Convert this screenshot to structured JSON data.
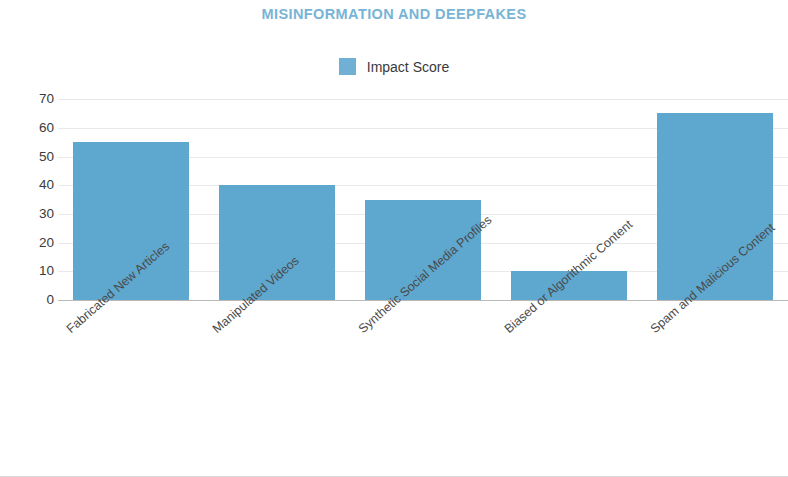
{
  "chart_data": {
    "type": "bar",
    "title": "MISINFORMATION AND DEEPFAKES",
    "categories": [
      "Fabricated New Articles",
      "Manipulated Videos",
      "Synthetic Social Media Profiles",
      "Biased or Algorithmic Content",
      "Spam and Malicious Content"
    ],
    "series": [
      {
        "name": "Impact Score",
        "values": [
          55,
          40,
          35,
          10,
          65
        ],
        "color": "#5ea8cf"
      }
    ],
    "values": [
      55,
      40,
      35,
      10,
      65
    ],
    "xlabel": "",
    "ylabel": "",
    "ylim": [
      0,
      70
    ],
    "yticks": [
      0,
      10,
      20,
      30,
      40,
      50,
      60,
      70
    ],
    "ytick_labels": [
      "0",
      "10",
      "20",
      "30",
      "40",
      "50",
      "60",
      "70"
    ],
    "grid": true,
    "legend": {
      "position": "top-center",
      "entries": [
        {
          "label": "Impact Score",
          "color": "#5ea8cf"
        }
      ]
    },
    "title_color": "#78b4d6",
    "axis_text_color": "#3a3a3a"
  }
}
